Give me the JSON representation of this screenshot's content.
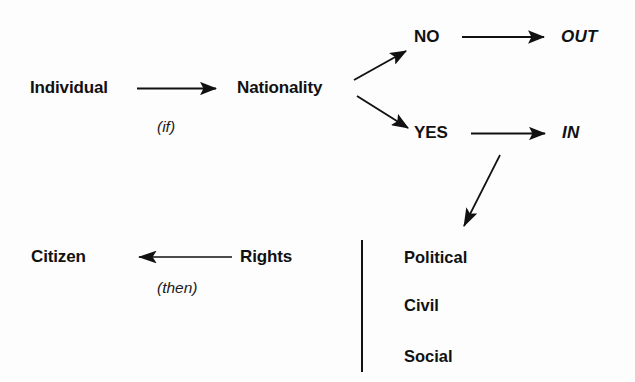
{
  "diagram": {
    "background_color": "#fdfdfd",
    "ink_color": "#111111",
    "nodes": {
      "individual": "Individual",
      "nationality": "Nationality",
      "no": "NO",
      "yes": "YES",
      "out": "OUT",
      "in": "IN",
      "citizen": "Citizen",
      "rights": "Rights"
    },
    "annotations": {
      "if": "(if)",
      "then": "(then)"
    },
    "rights_list": [
      "Political",
      "Civil",
      "Social"
    ],
    "edges": [
      {
        "name": "individual-to-nationality",
        "from": "Individual",
        "to": "Nationality",
        "label": "(if)",
        "style": "straight-arrow-right"
      },
      {
        "name": "nationality-to-no",
        "from": "Nationality",
        "to": "NO",
        "label": "",
        "style": "diagonal-arrow-up-right"
      },
      {
        "name": "nationality-to-yes",
        "from": "Nationality",
        "to": "YES",
        "label": "",
        "style": "diagonal-arrow-down-right"
      },
      {
        "name": "no-to-out",
        "from": "NO",
        "to": "OUT",
        "label": "",
        "style": "straight-arrow-right"
      },
      {
        "name": "yes-to-in",
        "from": "YES",
        "to": "IN",
        "label": "",
        "style": "straight-arrow-right"
      },
      {
        "name": "yes-to-rights-list",
        "from": "YES",
        "to": "Political / Civil / Social",
        "label": "",
        "style": "diagonal-arrow-down-left"
      },
      {
        "name": "rights-to-citizen",
        "from": "Rights",
        "to": "Citizen",
        "label": "(then)",
        "style": "straight-arrow-left"
      }
    ]
  }
}
